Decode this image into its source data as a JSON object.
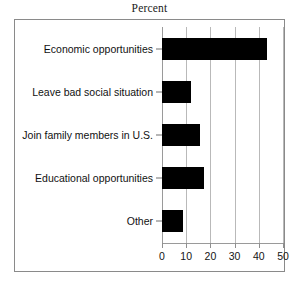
{
  "chart_data": {
    "type": "bar",
    "orientation": "horizontal",
    "title": "Percent",
    "xlabel": "",
    "ylabel": "",
    "xlim": [
      0,
      50
    ],
    "xticks": [
      0,
      10,
      20,
      30,
      40,
      50
    ],
    "xtick_labels": [
      "0",
      "10",
      "20",
      "30",
      "40",
      "50"
    ],
    "grid": true,
    "legend": false,
    "bar_color": "#000000",
    "categories": [
      "Economic opportunities",
      "Leave bad social situation",
      "Join family members in U.S.",
      "Educational opportunities",
      "Other"
    ],
    "values": [
      43.5,
      12,
      15.5,
      17.5,
      8.5
    ]
  },
  "figure": {
    "title": "Percent",
    "frame_color": "#8a8a8a",
    "background": "#ffffff"
  }
}
